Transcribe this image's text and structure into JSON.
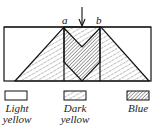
{
  "diagram": {
    "point_labels": {
      "a": "a",
      "b": "b"
    },
    "arrow": "down-arrow",
    "regions": [
      {
        "name": "Light yellow",
        "pattern": "none",
        "color": "#ffffff"
      },
      {
        "name": "Dark yellow",
        "pattern": "sparse-hatch",
        "color": "#ffffff"
      },
      {
        "name": "Blue",
        "pattern": "dense-hatch",
        "color": "#ffffff"
      }
    ]
  },
  "legend": [
    {
      "line1": "Light",
      "line2": "yellow"
    },
    {
      "line1": "Dark",
      "line2": "yellow"
    },
    {
      "line1": "Blue",
      "line2": ""
    }
  ]
}
